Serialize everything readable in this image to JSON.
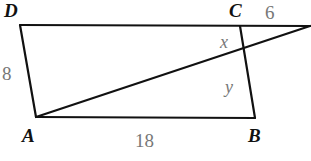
{
  "diagram": {
    "type": "geometry-figure",
    "vertices": [
      {
        "id": "D",
        "label": "D",
        "x": 20,
        "y": 25,
        "label_x": 4,
        "label_y": 17
      },
      {
        "id": "C",
        "label": "C",
        "x": 240,
        "y": 26,
        "label_x": 229,
        "label_y": 17
      },
      {
        "id": "A",
        "label": "A",
        "x": 36,
        "y": 117,
        "label_x": 22,
        "label_y": 142
      },
      {
        "id": "B",
        "label": "B",
        "x": 255,
        "y": 118,
        "label_x": 248,
        "label_y": 142
      },
      {
        "id": "E",
        "label": "",
        "x": 310,
        "y": 26
      }
    ],
    "edges": [
      {
        "from": "D",
        "to": "E"
      },
      {
        "from": "D",
        "to": "A"
      },
      {
        "from": "A",
        "to": "B"
      },
      {
        "from": "C",
        "to": "B"
      },
      {
        "from": "A",
        "to": "E"
      }
    ],
    "measurements": [
      {
        "label": "6",
        "x": 265,
        "y": 19,
        "describes": "segment from C to extension point"
      },
      {
        "label": "8",
        "x": 2,
        "y": 80,
        "describes": "side DA"
      },
      {
        "label": "18",
        "x": 135,
        "y": 147,
        "describes": "side AB"
      }
    ],
    "variables": [
      {
        "label": "x",
        "x": 220,
        "y": 48,
        "describes": "segment on CB above intersection"
      },
      {
        "label": "y",
        "x": 225,
        "y": 93,
        "describes": "segment on CB below intersection"
      }
    ]
  }
}
